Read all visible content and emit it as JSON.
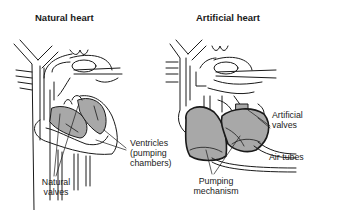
{
  "diagram": {
    "panels": [
      {
        "title": "Natural heart",
        "labels": {
          "ventricles": "Ventricles",
          "ventricles_sub1": "(pumping",
          "ventricles_sub2": "chambers)",
          "valves1": "Natural",
          "valves2": "valves"
        }
      },
      {
        "title": "Artificial heart",
        "labels": {
          "valves1": "Artificial",
          "valves2": "valves",
          "air_tubes": "Air tubes",
          "pumping1": "Pumping",
          "pumping2": "mechanism"
        }
      }
    ],
    "colors": {
      "chamber_fill": "#a8a8a8",
      "line": "#1a1a1a",
      "background": "#ffffff"
    }
  }
}
